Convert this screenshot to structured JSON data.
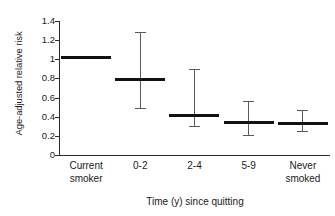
{
  "chart_data": {
    "type": "bar",
    "title": "",
    "subtitle": "",
    "xlabel": "Time (y) since quitting",
    "ylabel": "Age-adjusted relative risk",
    "categories": [
      "Current\nsmoker",
      "0-2",
      "2-4",
      "5-9",
      "Never\nsmoked"
    ],
    "values": [
      1.02,
      0.79,
      0.41,
      0.34,
      0.33
    ],
    "ci_low": [
      null,
      0.49,
      0.3,
      0.21,
      0.25
    ],
    "ci_high": [
      null,
      1.28,
      0.9,
      0.56,
      0.47
    ],
    "ylim": [
      0,
      1.4
    ],
    "yticks": [
      0,
      0.2,
      0.4,
      0.6,
      0.8,
      1,
      1.2,
      1.4
    ],
    "ytick_labels": [
      "0",
      "0.2",
      "0.4",
      "0.6",
      "0.8",
      "1",
      "1.2",
      "1.4"
    ],
    "grid": false,
    "legend": null,
    "legend_position": "none",
    "marker_color": "#111111",
    "whisker_color": "#5a5a5a",
    "axis_color": "#2b2b2b",
    "background": "#ffffff"
  }
}
